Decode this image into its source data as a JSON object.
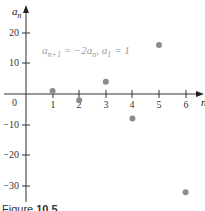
{
  "chart_data": {
    "type": "scatter",
    "title": "",
    "annotation": "a_{n+1} = −2a_n, a_1 = 1",
    "xlabel": "n",
    "ylabel": "a_n",
    "x": [
      1,
      2,
      3,
      4,
      5,
      6
    ],
    "values": [
      1,
      -2,
      4,
      -8,
      16,
      -32
    ],
    "xticks": [
      1,
      2,
      3,
      4,
      5,
      6
    ],
    "yticks": [
      -30,
      -20,
      -10,
      0,
      10,
      20
    ],
    "xlim": [
      0,
      6.5
    ],
    "ylim": [
      -35,
      25
    ],
    "grid": false,
    "legend": null,
    "point_color": "#8c8c8c"
  },
  "labels": {
    "y_axis": "a",
    "y_axis_sub": "n",
    "x_axis": "n",
    "origin": "0",
    "x_ticks": [
      "1",
      "2",
      "3",
      "4",
      "5",
      "6"
    ],
    "y_ticks": [
      "20",
      "10",
      "−10",
      "−20",
      "−30"
    ],
    "formula_a": "a",
    "formula_sub1": "n+1",
    "formula_mid": " = −2a",
    "formula_sub2": "n",
    "formula_mid2": ", a",
    "formula_sub3": "1",
    "formula_end": " = 1"
  },
  "caption": {
    "prefix": "Figure ",
    "number": "10.5"
  }
}
